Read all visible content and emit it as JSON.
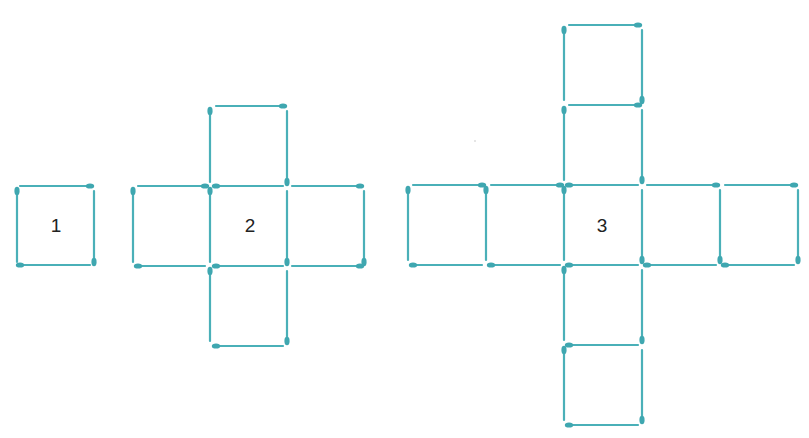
{
  "colors": {
    "stick": "#4ab0b8",
    "head": "#3fa7b0",
    "label": "#222222"
  },
  "figures": [
    {
      "label": "1",
      "label_pos": [
        56,
        226
      ],
      "sticks": [
        [
          20,
          186,
          90,
          186,
          "end"
        ],
        [
          94,
          191,
          94,
          262,
          "end"
        ],
        [
          90,
          265,
          20,
          265,
          "end"
        ],
        [
          17,
          262,
          17,
          191,
          "end"
        ]
      ]
    },
    {
      "label": "2",
      "label_pos": [
        250,
        226
      ],
      "sticks": [
        [
          216,
          106,
          283,
          106,
          "end"
        ],
        [
          287,
          111,
          287,
          182,
          "end"
        ],
        [
          210,
          182,
          210,
          111,
          "end"
        ],
        [
          138,
          186,
          205,
          186,
          "end"
        ],
        [
          216,
          186,
          283,
          186,
          "start"
        ],
        [
          292,
          186,
          360,
          186,
          "end"
        ],
        [
          133,
          262,
          133,
          191,
          "end"
        ],
        [
          210,
          191,
          210,
          262,
          "start"
        ],
        [
          287,
          191,
          287,
          262,
          "end"
        ],
        [
          364,
          191,
          364,
          262,
          "end"
        ],
        [
          205,
          266,
          138,
          266,
          "end"
        ],
        [
          283,
          266,
          216,
          266,
          "end"
        ],
        [
          360,
          266,
          292,
          266,
          "start"
        ],
        [
          210,
          341,
          210,
          271,
          "end"
        ],
        [
          287,
          271,
          287,
          341,
          "end"
        ],
        [
          283,
          346,
          216,
          346,
          "end"
        ]
      ]
    },
    {
      "label": "3",
      "label_pos": [
        602,
        226
      ],
      "sticks": [
        [
          569,
          25,
          638,
          25,
          "end"
        ],
        [
          642,
          30,
          642,
          100,
          "end"
        ],
        [
          564,
          100,
          564,
          30,
          "end"
        ],
        [
          569,
          105,
          638,
          105,
          "end"
        ],
        [
          564,
          180,
          564,
          110,
          "end"
        ],
        [
          642,
          110,
          642,
          180,
          "end"
        ],
        [
          413,
          185,
          482,
          185,
          "end"
        ],
        [
          491,
          185,
          560,
          185,
          "end"
        ],
        [
          569,
          185,
          638,
          185,
          "start"
        ],
        [
          647,
          185,
          716,
          185,
          "end"
        ],
        [
          725,
          185,
          794,
          185,
          "end"
        ],
        [
          408,
          260,
          408,
          190,
          "end"
        ],
        [
          486,
          190,
          486,
          260,
          "start"
        ],
        [
          564,
          190,
          564,
          260,
          "start"
        ],
        [
          642,
          190,
          642,
          260,
          "end"
        ],
        [
          720,
          190,
          720,
          260,
          "end"
        ],
        [
          798,
          190,
          798,
          260,
          "end"
        ],
        [
          482,
          265,
          413,
          265,
          "end"
        ],
        [
          560,
          265,
          491,
          265,
          "end"
        ],
        [
          638,
          265,
          569,
          265,
          "end"
        ],
        [
          716,
          265,
          647,
          265,
          "end"
        ],
        [
          794,
          265,
          725,
          265,
          "end"
        ],
        [
          564,
          340,
          564,
          270,
          "end"
        ],
        [
          642,
          270,
          642,
          340,
          "end"
        ],
        [
          638,
          345,
          569,
          345,
          "end"
        ],
        [
          564,
          350,
          564,
          420,
          "start"
        ],
        [
          642,
          350,
          642,
          420,
          "end"
        ],
        [
          638,
          425,
          569,
          425,
          "end"
        ]
      ]
    }
  ]
}
